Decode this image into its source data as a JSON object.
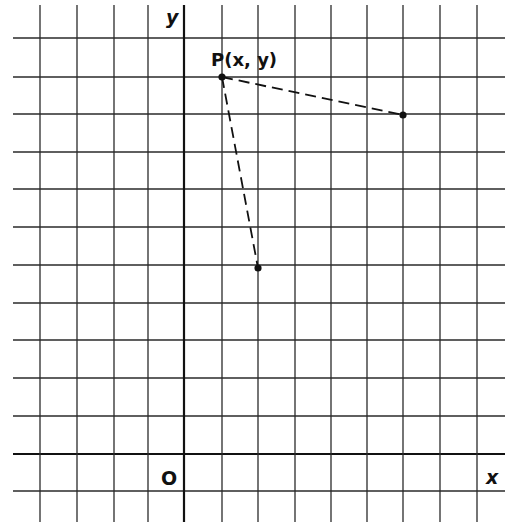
{
  "diagram": {
    "type": "coordinate-grid",
    "grid": {
      "origin_px": [
        184,
        454
      ],
      "cell_px": 37.2,
      "x_lines_px": [
        40,
        77,
        114,
        148,
        184,
        222,
        258,
        295,
        331,
        367,
        403,
        440,
        477
      ],
      "y_lines_px": [
        38,
        77,
        114,
        152,
        189,
        227,
        265,
        303,
        340,
        378,
        416,
        454,
        491
      ],
      "h_extent_px": [
        13,
        505
      ],
      "v_extent_px": [
        5,
        522
      ],
      "line_color": "#2a2a2a",
      "axis_color": "#111111"
    },
    "labels": {
      "y_axis": "y",
      "x_axis": "x",
      "origin": "O",
      "point_p": "P(x, y)"
    },
    "points": [
      {
        "name": "P",
        "px": [
          222,
          77
        ],
        "grid": [
          1,
          10
        ]
      },
      {
        "name": "A",
        "px": [
          403,
          115
        ],
        "grid": [
          6,
          9
        ]
      },
      {
        "name": "B",
        "px": [
          258,
          268
        ],
        "grid": [
          2,
          5
        ]
      }
    ],
    "segments": [
      {
        "from": "P",
        "to": "A",
        "style": "dashed"
      },
      {
        "from": "P",
        "to": "B",
        "style": "dashed"
      }
    ]
  }
}
